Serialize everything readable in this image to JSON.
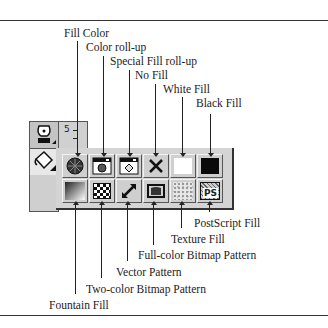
{
  "labels_top": [
    {
      "text": "Fill Color",
      "x": 64,
      "y": 27,
      "line_x": 77,
      "line_top": 41,
      "line_bot": 157
    },
    {
      "text": "Color roll-up",
      "x": 86,
      "y": 41,
      "line_x": 103,
      "line_top": 56,
      "line_bot": 157
    },
    {
      "text": "Special Fill roll-up",
      "x": 110,
      "y": 56,
      "line_x": 130,
      "line_top": 70,
      "line_bot": 157
    },
    {
      "text": "No Fill",
      "x": 136,
      "y": 70,
      "line_x": 156,
      "line_top": 84,
      "line_bot": 157
    },
    {
      "text": "White Fill",
      "x": 163,
      "y": 84,
      "line_x": 183,
      "line_top": 97,
      "line_bot": 157
    },
    {
      "text": "Black Fill",
      "x": 196,
      "y": 98,
      "line_x": 211,
      "line_top": 113,
      "line_bot": 157
    }
  ],
  "labels_bottom": [
    {
      "text": "PostScript Fill",
      "x": 194,
      "y": 217,
      "line_x": 209,
      "line_top": 204,
      "line_bot": 212
    },
    {
      "text": "Texture Fill",
      "x": 172,
      "y": 233,
      "line_x": 182,
      "line_top": 204,
      "line_bot": 228
    },
    {
      "text": "Full-color Bitmap Pattern",
      "x": 138,
      "y": 249,
      "line_x": 154,
      "line_top": 204,
      "line_bot": 245
    },
    {
      "text": "Vector Pattern",
      "x": 116,
      "y": 266,
      "line_x": 128,
      "line_top": 204,
      "line_bot": 261
    },
    {
      "text": "Two-color Bitmap Pattern",
      "x": 86,
      "y": 283,
      "line_x": 102,
      "line_top": 204,
      "line_bot": 278
    },
    {
      "text": "Fountain Fill",
      "x": 50,
      "y": 299,
      "line_x": 76,
      "line_top": 204,
      "line_bot": 294
    }
  ],
  "toolbar": {
    "row1": [
      "fill-color",
      "color-roll-up",
      "special-fill-roll-up",
      "no-fill",
      "white-fill",
      "black-fill"
    ],
    "row2": [
      "fountain-fill",
      "two-color-bitmap-pattern",
      "vector-pattern",
      "full-color-bitmap-pattern",
      "texture-fill",
      "postscript-fill"
    ],
    "ps_text": "PS"
  },
  "ruler": {
    "digit": "5"
  }
}
